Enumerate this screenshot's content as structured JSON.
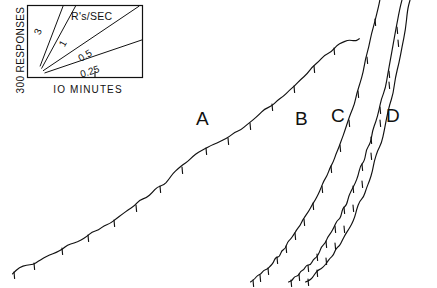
{
  "figure": {
    "type": "cumulative-record",
    "background_color": "#ffffff",
    "ink_color": "#111111",
    "width": 437,
    "height": 288
  },
  "legend": {
    "title": "R's/SEC",
    "y_axis_label": "300 RESPONSES",
    "x_axis_label": "IO MINUTES",
    "box": {
      "x": 27,
      "y": 5,
      "width": 116,
      "height": 73
    },
    "rate_lines": [
      {
        "label": "3",
        "value": 3,
        "angle_deg": 71
      },
      {
        "label": "1",
        "value": 1,
        "angle_deg": 62
      },
      {
        "label": "0.5",
        "value": 0.5,
        "angle_deg": 34
      },
      {
        "label": "0.25",
        "value": 0.25,
        "angle_deg": 18
      }
    ]
  },
  "curves": [
    {
      "label": "A",
      "label_x": 196,
      "label_y": 108
    },
    {
      "label": "B",
      "label_x": 295,
      "label_y": 108
    },
    {
      "label": "C",
      "label_x": 331,
      "label_y": 105
    },
    {
      "label": "D",
      "label_x": 386,
      "label_y": 105
    }
  ],
  "chart_data": {
    "type": "line",
    "title": "",
    "subtitle": "",
    "xlabel": "IO MINUTES",
    "ylabel": "300 RESPONSES",
    "grid": false,
    "legend_position": "top-left-inset",
    "annotations": [
      "A",
      "B",
      "C",
      "D",
      "R's/SEC",
      "3",
      "1",
      "0.5",
      "0.25"
    ],
    "rate_calibration": {
      "units": "R's/SEC",
      "values": [
        3,
        1,
        0.5,
        0.25
      ],
      "x_scale": "10 MINUTES",
      "y_scale": "300 RESPONSES"
    },
    "series": [
      {
        "name": "A",
        "points": [
          [
            12,
            273
          ],
          [
            20,
            268
          ],
          [
            27,
            266
          ],
          [
            33,
            264
          ],
          [
            38,
            261
          ],
          [
            44,
            259
          ],
          [
            50,
            256
          ],
          [
            56,
            252
          ],
          [
            62,
            248
          ],
          [
            68,
            246
          ],
          [
            74,
            243
          ],
          [
            80,
            239
          ],
          [
            86,
            236
          ],
          [
            92,
            232
          ],
          [
            98,
            229
          ],
          [
            104,
            226
          ],
          [
            110,
            222
          ],
          [
            116,
            218
          ],
          [
            122,
            214
          ],
          [
            128,
            210
          ],
          [
            134,
            206
          ],
          [
            140,
            201
          ],
          [
            146,
            197
          ],
          [
            152,
            192
          ],
          [
            158,
            188
          ],
          [
            163,
            184
          ],
          [
            168,
            179
          ],
          [
            173,
            174
          ],
          [
            178,
            169
          ],
          [
            183,
            165
          ],
          [
            188,
            161
          ],
          [
            193,
            157
          ],
          [
            199,
            153
          ],
          [
            205,
            149
          ],
          [
            211,
            146
          ],
          [
            217,
            143
          ],
          [
            223,
            140
          ],
          [
            229,
            137
          ],
          [
            235,
            133
          ],
          [
            241,
            129
          ],
          [
            247,
            125
          ],
          [
            253,
            120
          ],
          [
            259,
            115
          ],
          [
            265,
            110
          ],
          [
            271,
            105
          ],
          [
            277,
            100
          ],
          [
            283,
            95
          ],
          [
            289,
            90
          ],
          [
            295,
            85
          ],
          [
            301,
            80
          ],
          [
            307,
            74
          ],
          [
            313,
            68
          ],
          [
            319,
            62
          ],
          [
            325,
            56
          ],
          [
            331,
            51
          ],
          [
            337,
            46
          ],
          [
            343,
            43
          ],
          [
            349,
            41
          ],
          [
            355,
            40
          ],
          [
            360,
            40
          ]
        ],
        "pips": [
          [
            14,
            272
          ],
          [
            34,
            263
          ],
          [
            62,
            248
          ],
          [
            88,
            235
          ],
          [
            114,
            220
          ],
          [
            136,
            205
          ],
          [
            160,
            186
          ],
          [
            182,
            167
          ],
          [
            206,
            148
          ],
          [
            228,
            138
          ],
          [
            250,
            123
          ],
          [
            272,
            104
          ],
          [
            294,
            86
          ],
          [
            314,
            66
          ],
          [
            334,
            48
          ]
        ]
      },
      {
        "name": "B",
        "points": [
          [
            250,
            281
          ],
          [
            255,
            279
          ],
          [
            258,
            276
          ],
          [
            261,
            275
          ],
          [
            264,
            271
          ],
          [
            267,
            269
          ],
          [
            270,
            265
          ],
          [
            273,
            263
          ],
          [
            276,
            258
          ],
          [
            279,
            256
          ],
          [
            282,
            251
          ],
          [
            285,
            248
          ],
          [
            288,
            243
          ],
          [
            291,
            240
          ],
          [
            294,
            234
          ],
          [
            297,
            231
          ],
          [
            300,
            225
          ],
          [
            303,
            221
          ],
          [
            306,
            215
          ],
          [
            309,
            211
          ],
          [
            312,
            204
          ],
          [
            315,
            200
          ],
          [
            318,
            193
          ],
          [
            321,
            188
          ],
          [
            324,
            181
          ],
          [
            327,
            176
          ],
          [
            330,
            168
          ],
          [
            333,
            162
          ],
          [
            336,
            154
          ],
          [
            339,
            148
          ],
          [
            342,
            139
          ],
          [
            345,
            132
          ],
          [
            348,
            122
          ],
          [
            351,
            114
          ],
          [
            354,
            103
          ],
          [
            357,
            94
          ],
          [
            360,
            82
          ],
          [
            363,
            72
          ],
          [
            366,
            60
          ],
          [
            369,
            48
          ],
          [
            372,
            34
          ],
          [
            375,
            20
          ],
          [
            378,
            6
          ],
          [
            380,
            0
          ]
        ],
        "pips": [
          [
            253,
            280
          ],
          [
            260,
            275
          ],
          [
            268,
            268
          ],
          [
            277,
            257
          ],
          [
            286,
            246
          ],
          [
            295,
            233
          ],
          [
            304,
            219
          ],
          [
            313,
            203
          ],
          [
            322,
            186
          ],
          [
            331,
            166
          ],
          [
            340,
            145
          ],
          [
            349,
            120
          ],
          [
            358,
            91
          ],
          [
            367,
            57
          ],
          [
            375,
            19
          ]
        ]
      },
      {
        "name": "C",
        "points": [
          [
            288,
            281
          ],
          [
            292,
            280
          ],
          [
            295,
            277
          ],
          [
            298,
            276
          ],
          [
            301,
            272
          ],
          [
            304,
            270
          ],
          [
            307,
            266
          ],
          [
            310,
            264
          ],
          [
            313,
            259
          ],
          [
            316,
            256
          ],
          [
            319,
            251
          ],
          [
            322,
            248
          ],
          [
            325,
            242
          ],
          [
            328,
            238
          ],
          [
            331,
            232
          ],
          [
            334,
            228
          ],
          [
            337,
            221
          ],
          [
            340,
            217
          ],
          [
            343,
            209
          ],
          [
            346,
            204
          ],
          [
            349,
            196
          ],
          [
            352,
            191
          ],
          [
            355,
            182
          ],
          [
            358,
            176
          ],
          [
            361,
            167
          ],
          [
            364,
            160
          ],
          [
            367,
            150
          ],
          [
            370,
            142
          ],
          [
            373,
            131
          ],
          [
            376,
            122
          ],
          [
            379,
            110
          ],
          [
            382,
            100
          ],
          [
            385,
            87
          ],
          [
            388,
            75
          ],
          [
            391,
            60
          ],
          [
            394,
            45
          ],
          [
            397,
            28
          ],
          [
            400,
            10
          ],
          [
            402,
            0
          ]
        ],
        "pips": [
          [
            291,
            280
          ],
          [
            299,
            274
          ],
          [
            308,
            265
          ],
          [
            317,
            254
          ],
          [
            326,
            241
          ],
          [
            335,
            226
          ],
          [
            344,
            207
          ],
          [
            353,
            186
          ],
          [
            362,
            164
          ],
          [
            371,
            137
          ],
          [
            380,
            107
          ],
          [
            389,
            71
          ],
          [
            397,
            27
          ]
        ]
      },
      {
        "name": "D",
        "points": [
          [
            305,
            281
          ],
          [
            309,
            279
          ],
          [
            312,
            277
          ],
          [
            315,
            275
          ],
          [
            318,
            271
          ],
          [
            321,
            269
          ],
          [
            324,
            265
          ],
          [
            327,
            262
          ],
          [
            330,
            258
          ],
          [
            333,
            254
          ],
          [
            336,
            249
          ],
          [
            339,
            245
          ],
          [
            342,
            239
          ],
          [
            345,
            234
          ],
          [
            348,
            228
          ],
          [
            351,
            223
          ],
          [
            354,
            216
          ],
          [
            357,
            210
          ],
          [
            360,
            202
          ],
          [
            363,
            196
          ],
          [
            366,
            187
          ],
          [
            369,
            180
          ],
          [
            372,
            170
          ],
          [
            375,
            162
          ],
          [
            378,
            151
          ],
          [
            381,
            142
          ],
          [
            384,
            130
          ],
          [
            387,
            119
          ],
          [
            390,
            106
          ],
          [
            393,
            93
          ],
          [
            396,
            78
          ],
          [
            399,
            63
          ],
          [
            402,
            46
          ],
          [
            405,
            29
          ],
          [
            408,
            11
          ],
          [
            410,
            0
          ]
        ],
        "pips": [
          [
            308,
            279
          ],
          [
            317,
            270
          ],
          [
            326,
            258
          ],
          [
            335,
            243
          ],
          [
            344,
            226
          ],
          [
            353,
            205
          ],
          [
            362,
            181
          ],
          [
            371,
            153
          ],
          [
            380,
            120
          ],
          [
            389,
            82
          ],
          [
            398,
            40
          ]
        ]
      }
    ]
  }
}
